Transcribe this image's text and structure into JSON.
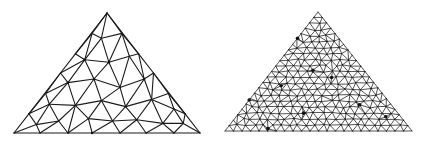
{
  "figure": {
    "line_color": "#1a1a1a",
    "background": "#ffffff"
  },
  "meshes": [
    {
      "id": "coarse",
      "label": "coarse-mesh",
      "refinement": "coarse",
      "nodes_normalized": [
        [
          0.0,
          0.0
        ],
        [
          0.5,
          1.0
        ],
        [
          1.0,
          0.0
        ],
        [
          0.14,
          0.0
        ],
        [
          0.29,
          0.0
        ],
        [
          0.42,
          0.0
        ],
        [
          0.57,
          0.0
        ],
        [
          0.71,
          0.0
        ],
        [
          0.86,
          0.0
        ],
        [
          0.08,
          0.16
        ],
        [
          0.17,
          0.33
        ],
        [
          0.25,
          0.5
        ],
        [
          0.33,
          0.66
        ],
        [
          0.42,
          0.83
        ],
        [
          0.92,
          0.16
        ],
        [
          0.83,
          0.33
        ],
        [
          0.75,
          0.5
        ],
        [
          0.67,
          0.66
        ],
        [
          0.58,
          0.83
        ],
        [
          0.47,
          0.79
        ],
        [
          0.38,
          0.61
        ],
        [
          0.51,
          0.59
        ],
        [
          0.62,
          0.64
        ],
        [
          0.29,
          0.42
        ],
        [
          0.43,
          0.45
        ],
        [
          0.57,
          0.38
        ],
        [
          0.7,
          0.45
        ],
        [
          0.19,
          0.24
        ],
        [
          0.33,
          0.23
        ],
        [
          0.47,
          0.27
        ],
        [
          0.6,
          0.22
        ],
        [
          0.74,
          0.28
        ],
        [
          0.86,
          0.2
        ],
        [
          0.12,
          0.07
        ],
        [
          0.24,
          0.1
        ],
        [
          0.4,
          0.12
        ],
        [
          0.53,
          0.1
        ],
        [
          0.66,
          0.11
        ],
        [
          0.8,
          0.08
        ],
        [
          0.91,
          0.08
        ]
      ],
      "hub_nodes": [
        20,
        21,
        24,
        26,
        23,
        5
      ]
    },
    {
      "id": "fine",
      "label": "refined-mesh",
      "refinement": "fine",
      "boundary_divisions": 22,
      "interior_rows": 20,
      "jitter": 0.28,
      "seed": 7,
      "hub_nodes_normalized": [
        [
          0.36,
          0.78
        ],
        [
          0.47,
          0.51
        ],
        [
          0.3,
          0.38
        ],
        [
          0.57,
          0.45
        ],
        [
          0.42,
          0.15
        ],
        [
          0.12,
          0.26
        ],
        [
          0.72,
          0.22
        ],
        [
          0.86,
          0.12
        ],
        [
          0.23,
          0.02
        ]
      ]
    }
  ]
}
